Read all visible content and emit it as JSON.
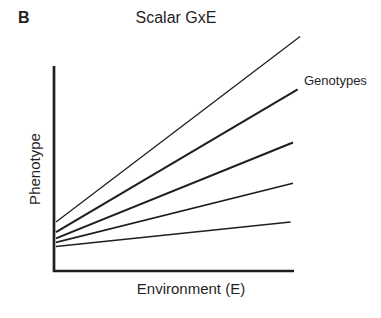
{
  "figure": {
    "panel_label": "B",
    "title": "Scalar GxE",
    "annotation": "Genotypes",
    "xlabel": "Environment (E)",
    "ylabel": "Phenotype"
  },
  "colors": {
    "ink": "#1f1f1f",
    "background": "#ffffff"
  },
  "chart_data": {
    "type": "line",
    "title": "Scalar GxE",
    "xlabel": "Environment (E)",
    "ylabel": "Phenotype",
    "annotation": "Genotypes",
    "legend": "none",
    "grid": false,
    "ticks": "none",
    "x_range": [
      0,
      1
    ],
    "y_range": [
      0,
      1
    ],
    "series": [
      {
        "name": "genotype-1",
        "x": [
          0,
          1.03
        ],
        "y": [
          0.24,
          1.15
        ]
      },
      {
        "name": "genotype-2",
        "x": [
          0,
          1.02
        ],
        "y": [
          0.19,
          0.89
        ]
      },
      {
        "name": "genotype-3",
        "x": [
          0,
          1.0
        ],
        "y": [
          0.16,
          0.63
        ]
      },
      {
        "name": "genotype-4",
        "x": [
          0,
          1.0
        ],
        "y": [
          0.14,
          0.43
        ]
      },
      {
        "name": "genotype-5",
        "x": [
          0,
          0.99
        ],
        "y": [
          0.12,
          0.24
        ]
      }
    ]
  }
}
